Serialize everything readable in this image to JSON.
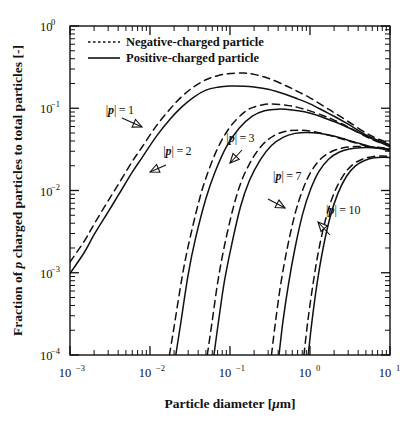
{
  "chart_data": {
    "type": "line",
    "title": "",
    "xlabel": "Particle diameter [μm]",
    "ylabel": "Fraction of p charged particles to total particles [-]",
    "xscale": "log",
    "yscale": "log",
    "xlim": [
      0.001,
      10
    ],
    "ylim": [
      0.0001,
      1
    ],
    "grid": false,
    "legend_position": "top-left",
    "xticks": [
      "10⁻³",
      "10⁻²",
      "10⁻¹",
      "10⁰",
      "10¹"
    ],
    "xtick_values": [
      0.001,
      0.01,
      0.1,
      1,
      10
    ],
    "yticks": [
      "10⁰",
      "10⁻¹",
      "10⁻²",
      "10⁻³",
      "10⁻⁴"
    ],
    "ytick_values": [
      1,
      0.1,
      0.01,
      0.001,
      0.0001
    ],
    "legend": [
      {
        "label": "Negative-charged particle",
        "style": "dotted"
      },
      {
        "label": "Positive-charged particle",
        "style": "solid"
      }
    ],
    "annotations": [
      {
        "text": "|p| = 1",
        "x": 0.0042,
        "y": 0.086
      },
      {
        "text": "|p| = 2",
        "x": 0.022,
        "y": 0.027
      },
      {
        "text": "|p| = 3",
        "x": 0.135,
        "y": 0.039
      },
      {
        "text": "|p| = 7",
        "x": 0.52,
        "y": 0.0135
      },
      {
        "text": "|p| = 10",
        "x": 2.6,
        "y": 0.0052
      }
    ],
    "series": [
      {
        "name": "|p|=1 negative",
        "charge": 1,
        "polarity": "negative",
        "style": "dashed",
        "x": [
          0.001,
          0.0015,
          0.002,
          0.003,
          0.004,
          0.006,
          0.008,
          0.012,
          0.018,
          0.025,
          0.035,
          0.05,
          0.07,
          0.1,
          0.15,
          0.2,
          0.3,
          0.5,
          0.7,
          1.0,
          1.5,
          2.0,
          3.0,
          5.0,
          7.0,
          10.0
        ],
        "y": [
          0.00135,
          0.0024,
          0.0039,
          0.0075,
          0.0118,
          0.0225,
          0.034,
          0.061,
          0.099,
          0.139,
          0.181,
          0.222,
          0.249,
          0.265,
          0.268,
          0.258,
          0.232,
          0.188,
          0.16,
          0.134,
          0.105,
          0.0885,
          0.069,
          0.05,
          0.0425,
          0.0375
        ]
      },
      {
        "name": "|p|=1 positive",
        "charge": 1,
        "polarity": "positive",
        "style": "solid",
        "x": [
          0.001,
          0.0015,
          0.002,
          0.003,
          0.004,
          0.006,
          0.008,
          0.012,
          0.018,
          0.025,
          0.035,
          0.05,
          0.07,
          0.1,
          0.15,
          0.2,
          0.3,
          0.5,
          0.7,
          1.0,
          1.5,
          2.0,
          3.0,
          5.0,
          7.0,
          10.0
        ],
        "y": [
          0.00098,
          0.00175,
          0.0029,
          0.0055,
          0.0087,
          0.0167,
          0.0253,
          0.0455,
          0.0745,
          0.104,
          0.136,
          0.166,
          0.18,
          0.186,
          0.185,
          0.181,
          0.17,
          0.147,
          0.13,
          0.113,
          0.0925,
          0.08,
          0.064,
          0.0475,
          0.0408,
          0.036
        ]
      },
      {
        "name": "|p|=2 negative",
        "charge": 2,
        "polarity": "negative",
        "style": "dashed",
        "x": [
          0.0175,
          0.02,
          0.025,
          0.03,
          0.04,
          0.05,
          0.07,
          0.1,
          0.15,
          0.2,
          0.3,
          0.5,
          0.7,
          1.0,
          1.5,
          2.0,
          3.0,
          5.0,
          7.0,
          10.0
        ],
        "y": [
          0.0001,
          0.00022,
          0.00085,
          0.0021,
          0.0068,
          0.0142,
          0.0325,
          0.059,
          0.089,
          0.1035,
          0.1125,
          0.109,
          0.1025,
          0.093,
          0.0805,
          0.0718,
          0.0592,
          0.0452,
          0.0392,
          0.035
        ]
      },
      {
        "name": "|p|=2 positive",
        "charge": 2,
        "polarity": "positive",
        "style": "solid",
        "x": [
          0.021,
          0.024,
          0.03,
          0.037,
          0.05,
          0.065,
          0.09,
          0.13,
          0.19,
          0.27,
          0.4,
          0.6,
          0.85,
          1.2,
          1.8,
          2.5,
          4.0,
          6.0,
          8.0,
          10.0
        ],
        "y": [
          0.0001,
          0.00023,
          0.00095,
          0.0026,
          0.008,
          0.0168,
          0.034,
          0.057,
          0.08,
          0.093,
          0.0975,
          0.0955,
          0.0905,
          0.0828,
          0.0715,
          0.063,
          0.051,
          0.0425,
          0.0375,
          0.034
        ]
      },
      {
        "name": "|p|=3 negative",
        "charge": 3,
        "polarity": "negative",
        "style": "dashed",
        "x": [
          0.052,
          0.06,
          0.07,
          0.085,
          0.11,
          0.14,
          0.19,
          0.26,
          0.36,
          0.5,
          0.7,
          1.0,
          1.5,
          2.2,
          3.2,
          5.0,
          7.0,
          10.0
        ],
        "y": [
          0.0001,
          0.00026,
          0.00075,
          0.0021,
          0.0062,
          0.0132,
          0.0243,
          0.0367,
          0.0468,
          0.0525,
          0.054,
          0.0528,
          0.0488,
          0.044,
          0.0395,
          0.035,
          0.0328,
          0.031
        ]
      },
      {
        "name": "|p|=3 positive",
        "charge": 3,
        "polarity": "positive",
        "style": "solid",
        "x": [
          0.063,
          0.072,
          0.085,
          0.105,
          0.135,
          0.175,
          0.24,
          0.33,
          0.46,
          0.65,
          0.9,
          1.3,
          1.9,
          2.8,
          4.2,
          6.2,
          8.2,
          10.0
        ],
        "y": [
          0.0001,
          0.00026,
          0.00078,
          0.0022,
          0.0063,
          0.0132,
          0.0238,
          0.0352,
          0.0443,
          0.0495,
          0.0508,
          0.0496,
          0.0462,
          0.0418,
          0.0372,
          0.0335,
          0.0318,
          0.0305
        ]
      },
      {
        "name": "|p|=7 negative",
        "charge": 7,
        "polarity": "negative",
        "style": "dashed",
        "x": [
          0.33,
          0.37,
          0.43,
          0.52,
          0.65,
          0.82,
          1.05,
          1.4,
          1.9,
          2.6,
          3.6,
          5.0,
          7.0,
          10.0
        ],
        "y": [
          0.0001,
          0.00025,
          0.00072,
          0.002,
          0.0052,
          0.0105,
          0.0175,
          0.0248,
          0.03,
          0.033,
          0.0342,
          0.0342,
          0.0335,
          0.0325
        ]
      },
      {
        "name": "|p|=7 positive",
        "charge": 7,
        "polarity": "positive",
        "style": "solid",
        "x": [
          0.41,
          0.46,
          0.54,
          0.65,
          0.81,
          1.02,
          1.3,
          1.72,
          2.3,
          3.1,
          4.3,
          6.0,
          8.0,
          10.0
        ],
        "y": [
          0.0001,
          0.00026,
          0.00074,
          0.002,
          0.0052,
          0.0104,
          0.0172,
          0.0242,
          0.0292,
          0.032,
          0.0332,
          0.0332,
          0.0326,
          0.0318
        ]
      },
      {
        "name": "|p|=10 negative",
        "charge": 10,
        "polarity": "negative",
        "style": "dashed",
        "x": [
          0.84,
          0.94,
          1.1,
          1.3,
          1.6,
          2.0,
          2.6,
          3.4,
          4.5,
          6.0,
          8.0,
          10.0
        ],
        "y": [
          0.0001,
          0.00026,
          0.00077,
          0.002,
          0.0048,
          0.0093,
          0.0152,
          0.0205,
          0.024,
          0.0258,
          0.0262,
          0.0258
        ]
      },
      {
        "name": "|p|=10 positive",
        "charge": 10,
        "polarity": "positive",
        "style": "solid",
        "x": [
          0.95,
          1.06,
          1.23,
          1.46,
          1.78,
          2.22,
          2.85,
          3.7,
          4.9,
          6.4,
          8.4,
          10.0
        ],
        "y": [
          0.0001,
          0.00026,
          0.00076,
          0.002,
          0.0047,
          0.0091,
          0.0148,
          0.0199,
          0.0233,
          0.025,
          0.0254,
          0.0252
        ]
      }
    ]
  },
  "figure": {
    "ylabel_prefix": "Fraction of ",
    "ylabel_italic": "p",
    "ylabel_suffix": " charged particles to total particles [-]",
    "xlabel_prefix": "Particle diameter [",
    "xlabel_italic": "μ",
    "xlabel_suffix": "m]"
  }
}
